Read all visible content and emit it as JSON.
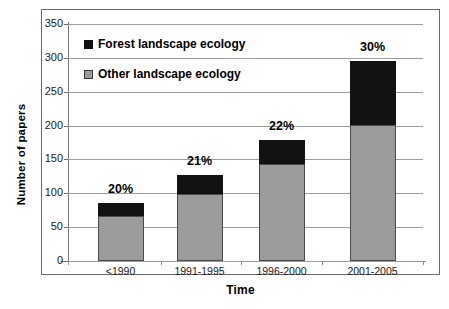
{
  "chart_data": {
    "type": "bar",
    "subtype": "stacked-bar",
    "title": "",
    "xlabel": "Time",
    "ylabel": "Number of papers",
    "categories": [
      "<1990",
      "1991-1995",
      "1996-2000",
      "2001-2005"
    ],
    "series": [
      {
        "name": "Other landscape ecology",
        "color": "#9b9b9b",
        "values": [
          66,
          99,
          143,
          201
        ]
      },
      {
        "name": "Forest landscape ecology",
        "color": "#121212",
        "values": [
          20,
          28,
          36,
          94
        ]
      }
    ],
    "totals": [
      86,
      127,
      179,
      295
    ],
    "annotations": [
      "20%",
      "21%",
      "22%",
      "30%"
    ],
    "ylim": [
      0,
      350
    ],
    "ytick_labels": [
      "0",
      "50",
      "100",
      "150",
      "200",
      "250",
      "300",
      "350"
    ],
    "ytick_values": [
      0,
      50,
      100,
      150,
      200,
      250,
      300,
      350
    ],
    "grid": true,
    "legend_position": "top-left",
    "legend_entries": [
      {
        "label": "Forest landscape ecology",
        "color": "#121212"
      },
      {
        "label": "Other landscape ecology",
        "color": "#9b9b9b"
      }
    ]
  }
}
